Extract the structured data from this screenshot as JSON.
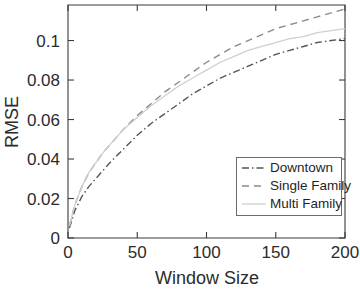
{
  "chart_data": {
    "type": "line",
    "title": "",
    "xlabel": "Window Size",
    "ylabel": "RMSE",
    "xlim": [
      0,
      200
    ],
    "ylim": [
      0,
      0.118
    ],
    "grid": false,
    "legend_position": "lower-right",
    "xticks": [
      "0",
      "50",
      "100",
      "150",
      "200"
    ],
    "xtick_values": [
      0,
      50,
      100,
      150,
      200
    ],
    "yticks": [
      "0",
      "0.02",
      "0.04",
      "0.06",
      "0.08",
      "0.1"
    ],
    "ytick_values": [
      0,
      0.02,
      0.04,
      0.06,
      0.08,
      0.1
    ],
    "x": [
      1,
      5,
      10,
      15,
      20,
      25,
      30,
      40,
      50,
      60,
      70,
      80,
      90,
      100,
      110,
      120,
      130,
      140,
      150,
      160,
      170,
      180,
      190,
      200
    ],
    "series": [
      {
        "name": "Downtown",
        "style": "dash-dot",
        "color": "#555555",
        "values": [
          0.005,
          0.014,
          0.021,
          0.026,
          0.03,
          0.034,
          0.038,
          0.045,
          0.052,
          0.058,
          0.063,
          0.068,
          0.073,
          0.077,
          0.081,
          0.084,
          0.087,
          0.09,
          0.093,
          0.095,
          0.097,
          0.099,
          0.1,
          0.101
        ]
      },
      {
        "name": "Single Family",
        "style": "dashed",
        "color": "#8a8a8a",
        "values": [
          0.006,
          0.017,
          0.026,
          0.033,
          0.038,
          0.043,
          0.047,
          0.055,
          0.062,
          0.068,
          0.074,
          0.079,
          0.084,
          0.089,
          0.093,
          0.097,
          0.1,
          0.103,
          0.106,
          0.108,
          0.11,
          0.112,
          0.114,
          0.116
        ]
      },
      {
        "name": "Multi Family",
        "style": "solid-light",
        "color": "#cfcfcf",
        "values": [
          0.006,
          0.017,
          0.026,
          0.033,
          0.038,
          0.043,
          0.047,
          0.055,
          0.061,
          0.067,
          0.072,
          0.077,
          0.081,
          0.085,
          0.089,
          0.092,
          0.095,
          0.097,
          0.099,
          0.101,
          0.102,
          0.104,
          0.105,
          0.106
        ]
      }
    ]
  },
  "legend": {
    "items": [
      {
        "label": "Downtown"
      },
      {
        "label": "Single Family"
      },
      {
        "label": "Multi Family"
      }
    ]
  }
}
